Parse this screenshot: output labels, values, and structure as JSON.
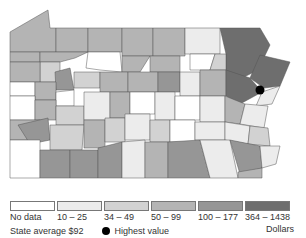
{
  "map": {
    "region": "Pennsylvania counties",
    "highest_value_marker": {
      "x": 260,
      "y": 90
    }
  },
  "legend": {
    "bins": [
      {
        "label": "No data",
        "color": "#ffffff"
      },
      {
        "label": "10 – 25",
        "color": "#ececec"
      },
      {
        "label": "34 – 49",
        "color": "#d2d2d2"
      },
      {
        "label": "50 – 99",
        "color": "#b4b4b4"
      },
      {
        "label": "100 – 177",
        "color": "#969696"
      },
      {
        "label": "364 – 1438",
        "color": "#6e6e6e"
      }
    ],
    "units": "Dollars",
    "state_average": "State average $92",
    "highest_value_label": "Highest value"
  }
}
